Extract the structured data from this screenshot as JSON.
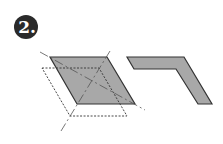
{
  "step": {
    "number": "2",
    "label": "2."
  },
  "diagram": {
    "colors": {
      "fill": "#a8a8a8",
      "stroke": "#333333",
      "badge": "#2a2a2a",
      "guide": "#666666"
    }
  }
}
